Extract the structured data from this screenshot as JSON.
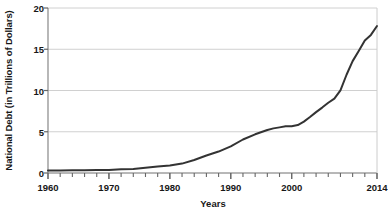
{
  "chart_data": {
    "type": "line",
    "title": "",
    "xlabel": "Years",
    "ylabel": "National Debt (in Trillions of Dollars)",
    "xlim": [
      1960,
      2014
    ],
    "ylim": [
      0,
      20
    ],
    "grid": true,
    "legend": "none",
    "line_color": "#333333",
    "grid_color": "#d0d0d0",
    "axis_color": "#808080",
    "y_ticks": [
      0,
      5,
      10,
      15,
      20
    ],
    "y_tick_labels": [
      "0",
      "5",
      "10",
      "15",
      "20"
    ],
    "x_ticks": [
      1960,
      1970,
      1980,
      1990,
      2000,
      2014
    ],
    "x_tick_labels": [
      "1960",
      "1970",
      "1980",
      "1990",
      "2000",
      "2014"
    ],
    "x_minor_tick_step": 2,
    "series": [
      {
        "name": "National Debt",
        "x": [
          1960,
          1962,
          1964,
          1966,
          1968,
          1970,
          1972,
          1974,
          1976,
          1978,
          1980,
          1982,
          1984,
          1986,
          1988,
          1990,
          1992,
          1994,
          1996,
          1997,
          1998,
          1999,
          2000,
          2001,
          2002,
          2003,
          2004,
          2005,
          2006,
          2007,
          2008,
          2009,
          2010,
          2011,
          2012,
          2013,
          2014
        ],
        "values": [
          0.29,
          0.3,
          0.32,
          0.33,
          0.35,
          0.37,
          0.44,
          0.48,
          0.63,
          0.78,
          0.91,
          1.14,
          1.57,
          2.12,
          2.6,
          3.23,
          4.06,
          4.69,
          5.22,
          5.41,
          5.53,
          5.66,
          5.67,
          5.81,
          6.23,
          6.78,
          7.38,
          7.93,
          8.51,
          9.01,
          10.02,
          11.91,
          13.56,
          14.79,
          16.07,
          16.74,
          17.82
        ]
      }
    ]
  }
}
